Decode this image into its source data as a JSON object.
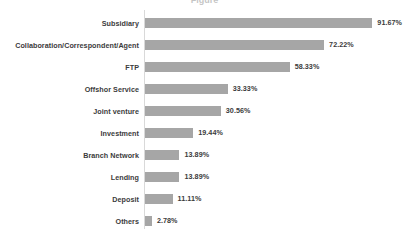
{
  "chart_data": {
    "type": "bar",
    "orientation": "horizontal",
    "title": "",
    "title_cropped_fragment": "Figure",
    "xlabel": "",
    "ylabel": "",
    "grid": false,
    "legend": null,
    "axis_color": "#d9d9d9",
    "bar_color": "#a6a6a6",
    "text_color": "#3b3b3b",
    "xlim": [
      0,
      100
    ],
    "value_suffix": "%",
    "categories": [
      "Subsidiary",
      "Collaboration/Correspondent/Agent",
      "FTP",
      "Offshor Service",
      "Joint venture",
      "Investment",
      "Branch Network",
      "Lending",
      "Deposit",
      "Others"
    ],
    "values": [
      91.67,
      72.22,
      58.33,
      33.33,
      30.56,
      19.44,
      13.89,
      13.89,
      11.11,
      2.78
    ],
    "value_labels": [
      "91.67%",
      "72.22%",
      "58.33%",
      "33.33%",
      "30.56%",
      "19.44%",
      "13.89%",
      "13.89%",
      "11.11%",
      "2.78%"
    ],
    "bars": [
      {
        "category": "Subsidiary",
        "value": 91.67,
        "label": "91.67%"
      },
      {
        "category": "Collaboration/Correspondent/Agent",
        "value": 72.22,
        "label": "72.22%"
      },
      {
        "category": "FTP",
        "value": 58.33,
        "label": "58.33%"
      },
      {
        "category": "Offshor Service",
        "value": 33.33,
        "label": "33.33%"
      },
      {
        "category": "Joint venture",
        "value": 30.56,
        "label": "30.56%"
      },
      {
        "category": "Investment",
        "value": 19.44,
        "label": "19.44%"
      },
      {
        "category": "Branch Network",
        "value": 13.89,
        "label": "13.89%"
      },
      {
        "category": "Lending",
        "value": 13.89,
        "label": "13.89%"
      },
      {
        "category": "Deposit",
        "value": 11.11,
        "label": "11.11%"
      },
      {
        "category": "Others",
        "value": 2.78,
        "label": "2.78%"
      }
    ]
  }
}
